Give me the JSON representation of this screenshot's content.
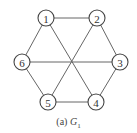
{
  "graph": {
    "name": "G1",
    "nodes": [
      {
        "id": "1",
        "label": "1",
        "x": 46,
        "y": 18
      },
      {
        "id": "2",
        "label": "2",
        "x": 97,
        "y": 18
      },
      {
        "id": "3",
        "label": "3",
        "x": 120,
        "y": 62
      },
      {
        "id": "4",
        "label": "4",
        "x": 96,
        "y": 102
      },
      {
        "id": "5",
        "label": "5",
        "x": 48,
        "y": 102
      },
      {
        "id": "6",
        "label": "6",
        "x": 22,
        "y": 62
      }
    ],
    "edges": [
      [
        "1",
        "2"
      ],
      [
        "2",
        "3"
      ],
      [
        "3",
        "4"
      ],
      [
        "4",
        "5"
      ],
      [
        "5",
        "6"
      ],
      [
        "6",
        "1"
      ],
      [
        "1",
        "4"
      ],
      [
        "2",
        "5"
      ],
      [
        "3",
        "6"
      ]
    ],
    "node_radius": 8
  },
  "caption": {
    "prefix": "(a) ",
    "symbol": "G",
    "subscript": "1"
  }
}
